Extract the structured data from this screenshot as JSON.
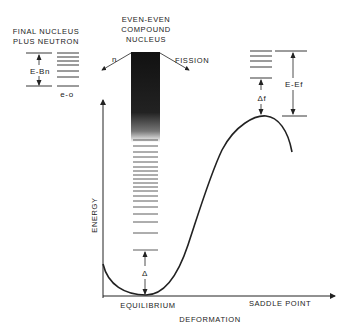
{
  "labels": {
    "final_nucleus_line1": "FINAL NUCLEUS",
    "final_nucleus_line2": "PLUS NEUTRON",
    "compound_line1": "EVEN-EVEN",
    "compound_line2": "COMPOUND",
    "compound_line3": "NUCLEUS",
    "neutron": "n",
    "fission": "FISSION",
    "e_bn": "E-Bn",
    "e_o": "e-o",
    "e_ef": "E-Ef",
    "delta_f": "Δf",
    "delta": "Δ",
    "y_axis": "ENERGY",
    "x_axis": "DEFORMATION",
    "equilibrium": "EQUILIBRIUM",
    "saddle_point": "SADDLE POINT"
  },
  "colors": {
    "ink": "#222222",
    "band": "#1a1a1a"
  }
}
